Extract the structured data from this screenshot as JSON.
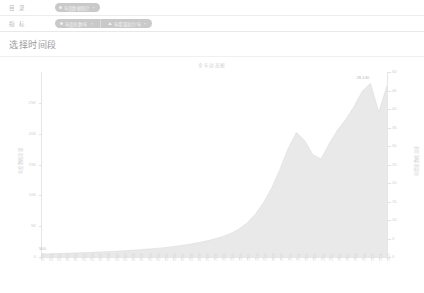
{
  "filters": {
    "rows": [
      {
        "label": "目 录",
        "chips": [
          {
            "type": "single",
            "icon": "dot",
            "text": "年度数据统计",
            "close": "×"
          }
        ]
      },
      {
        "label": "指 标",
        "chips": [
          {
            "type": "group",
            "segments": [
              {
                "icon": "dot",
                "text": "年度总数/年",
                "close": "×"
              },
              {
                "icon": "triangle",
                "text": "年增量总计/年",
                "close": "×"
              }
            ]
          }
        ]
      }
    ]
  },
  "page": {
    "title": "选择时间段"
  },
  "chart_data": {
    "type": "area",
    "title": "全年动态图",
    "xlabel": "",
    "ylabel": "年度数据总量",
    "y2label": "年增量数据总计",
    "ylim": [
      0,
      30000
    ],
    "y2lim": [
      0,
      50
    ],
    "yticks": [
      0,
      5000,
      10000,
      15000,
      20000,
      25000
    ],
    "yticklabels": [
      "0",
      "5K",
      "10K",
      "15K",
      "20K",
      "25K"
    ],
    "y2ticks": [
      0,
      5,
      10,
      15,
      20,
      25,
      30,
      35,
      40,
      45,
      50
    ],
    "y2ticklabels": [
      "0",
      "5",
      "10",
      "15",
      "20",
      "25",
      "30",
      "35",
      "40",
      "45",
      "50"
    ],
    "grid": false,
    "legend": "none",
    "annotations": [
      {
        "text": "500",
        "x_index": 0,
        "value": 500
      },
      {
        "text": "28,140",
        "x_index": 40,
        "value": 28140
      }
    ],
    "categories": [
      "1980",
      "1981",
      "1982",
      "1983",
      "1984",
      "1985",
      "1986",
      "1987",
      "1988",
      "1989",
      "1990",
      "1991",
      "1992",
      "1993",
      "1994",
      "1995",
      "1996",
      "1997",
      "1998",
      "1999",
      "2000",
      "2001",
      "2002",
      "2003",
      "2004",
      "2005",
      "2006",
      "2007",
      "2008",
      "2009",
      "2010",
      "2011",
      "2012",
      "2013",
      "2014",
      "2015",
      "2016",
      "2017",
      "2018",
      "2019",
      "2020",
      "2021",
      "2022"
    ],
    "values": [
      500,
      520,
      560,
      600,
      640,
      690,
      740,
      800,
      860,
      930,
      1000,
      1090,
      1180,
      1280,
      1390,
      1520,
      1680,
      1860,
      2060,
      2300,
      2580,
      2900,
      3300,
      3800,
      4500,
      5500,
      6900,
      8800,
      11200,
      14200,
      17600,
      20200,
      18900,
      16600,
      15900,
      18400,
      20600,
      22300,
      24400,
      26900,
      28140,
      23500,
      27800
    ]
  }
}
